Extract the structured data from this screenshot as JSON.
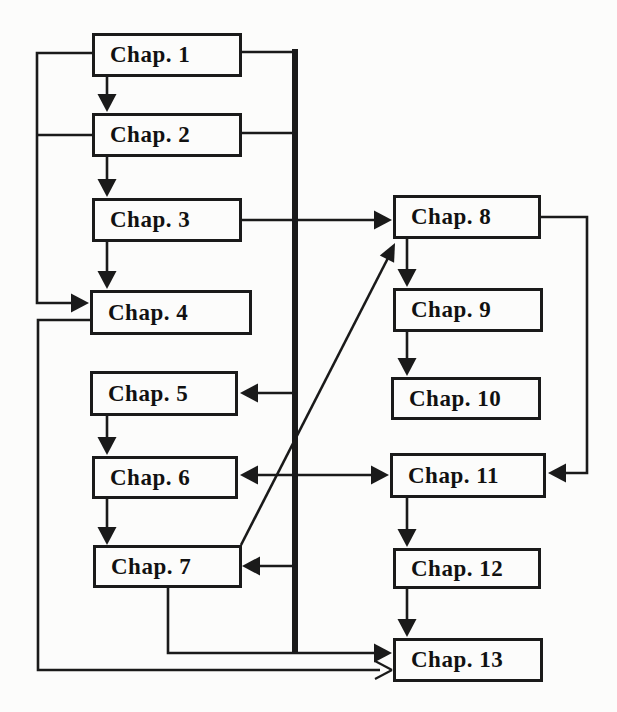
{
  "diagram": {
    "type": "flowchart",
    "nodes": [
      {
        "id": "chap-1",
        "label": "Chap. 1"
      },
      {
        "id": "chap-2",
        "label": "Chap. 2"
      },
      {
        "id": "chap-3",
        "label": "Chap. 3"
      },
      {
        "id": "chap-4",
        "label": "Chap. 4"
      },
      {
        "id": "chap-5",
        "label": "Chap. 5"
      },
      {
        "id": "chap-6",
        "label": "Chap. 6"
      },
      {
        "id": "chap-7",
        "label": "Chap. 7"
      },
      {
        "id": "chap-8",
        "label": "Chap. 8"
      },
      {
        "id": "chap-9",
        "label": "Chap. 9"
      },
      {
        "id": "chap-10",
        "label": "Chap. 10"
      },
      {
        "id": "chap-11",
        "label": "Chap. 11"
      },
      {
        "id": "chap-12",
        "label": "Chap. 12"
      },
      {
        "id": "chap-13",
        "label": "Chap. 13"
      }
    ],
    "edges": [
      {
        "from": "chap-1",
        "to": "chap-2",
        "style": "filled-arrow"
      },
      {
        "from": "chap-2",
        "to": "chap-3",
        "style": "filled-arrow"
      },
      {
        "from": "chap-3",
        "to": "chap-4",
        "style": "filled-arrow"
      },
      {
        "from": "chap-1",
        "to": "chap-4",
        "style": "filled-arrow",
        "route": "left-side"
      },
      {
        "from": "chap-2",
        "to": "chap-4",
        "style": "filled-arrow",
        "route": "left-side"
      },
      {
        "from": "chap-5",
        "to": "chap-6",
        "style": "filled-arrow"
      },
      {
        "from": "chap-6",
        "to": "chap-7",
        "style": "filled-arrow"
      },
      {
        "from": "chap-3",
        "to": "chap-8",
        "style": "filled-arrow"
      },
      {
        "from": "chap-7",
        "to": "chap-8",
        "style": "filled-arrow",
        "route": "diagonal"
      },
      {
        "from": "chap-8",
        "to": "chap-9",
        "style": "filled-arrow"
      },
      {
        "from": "chap-9",
        "to": "chap-10",
        "style": "filled-arrow"
      },
      {
        "from": "chap-8",
        "to": "chap-11",
        "style": "filled-arrow",
        "route": "right-side"
      },
      {
        "from": "chap-11",
        "to": "chap-12",
        "style": "filled-arrow"
      },
      {
        "from": "chap-12",
        "to": "chap-13",
        "style": "filled-arrow"
      },
      {
        "from": "main-line",
        "to": "chap-5",
        "style": "filled-arrow"
      },
      {
        "from": "chap-6",
        "to": "chap-11",
        "style": "filled-arrow",
        "bidirectional": true
      },
      {
        "from": "main-line",
        "to": "chap-7",
        "style": "filled-arrow"
      },
      {
        "from": "chap-7",
        "to": "chap-13",
        "style": "filled-arrow",
        "route": "bottom"
      },
      {
        "from": "chap-4",
        "to": "chap-13",
        "style": "open-arrow",
        "route": "bottom-left"
      },
      {
        "from": "main-line",
        "to": "chap-13",
        "style": "joins-bottom-line"
      }
    ],
    "main_line": {
      "sources": [
        "chap-1",
        "chap-2"
      ],
      "style": "thick-vertical"
    },
    "colors": {
      "line": "#1a1a1a",
      "background": "#fcfcfb",
      "box_fill": "#fcfcfb",
      "text": "#111111"
    }
  }
}
